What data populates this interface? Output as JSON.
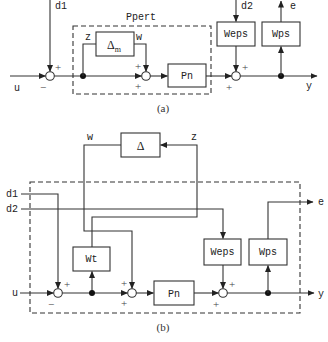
{
  "figure": {
    "colors": {
      "line": "#333333",
      "background": "#ffffff"
    },
    "panel_a": {
      "caption": "(a)",
      "group_label": "Ppert",
      "signals": {
        "d1": "d1",
        "d2": "d2",
        "u": "u",
        "z": "z",
        "w": "w",
        "e": "e",
        "y": "y"
      },
      "blocks": {
        "delta": "Δ",
        "delta_sub": "m",
        "pn": "Pn",
        "weps": "Weps",
        "wps": "Wps"
      },
      "signs": {
        "sum1_top": "+",
        "sum1_bottom": "−",
        "sum2_top": "+",
        "sum2_bottom": "+",
        "sum3_top": "+",
        "sum3_bottom": "+"
      }
    },
    "panel_b": {
      "caption": "(b)",
      "signals": {
        "d1": "d1",
        "d2": "d2",
        "u": "u",
        "z": "z",
        "w": "w",
        "e": "e",
        "y": "y"
      },
      "blocks": {
        "delta": "Δ",
        "wt": "Wt",
        "pn": "Pn",
        "weps": "Weps",
        "wps": "Wps"
      },
      "signs": {
        "sum1_top": "+",
        "sum1_bottom": "−",
        "sum2_top": "+",
        "sum2_bottom": "+",
        "sum3_top": "+",
        "sum3_bottom": "+"
      }
    }
  }
}
